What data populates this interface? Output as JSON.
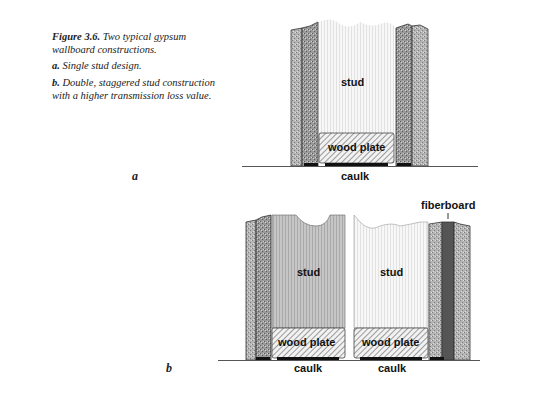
{
  "caption": {
    "figure_number": "Figure 3.6.",
    "title": "Two typical gypsum wallboard constructions.",
    "items": [
      {
        "key": "a.",
        "text": "Single stud design."
      },
      {
        "key": "b.",
        "text": "Double, staggered stud construction with a higher transmission loss value."
      }
    ]
  },
  "diagram_a": {
    "panel_label": "a",
    "labels": {
      "stud": "stud",
      "wood_plate": "wood plate",
      "caulk": "caulk"
    }
  },
  "diagram_b": {
    "panel_label": "b",
    "labels": {
      "stud_left": "stud",
      "stud_right": "stud",
      "wood_plate_left": "wood plate",
      "wood_plate_right": "wood plate",
      "caulk_left": "caulk",
      "caulk_right": "caulk",
      "fiberboard": "fiberboard"
    }
  },
  "colors": {
    "gypsum_light": "#b8b8b8",
    "gypsum_dark": "#8e8e8e",
    "stud_gray": "#c4c4c4",
    "stud_white": "#f3f3f3",
    "fiberboard": "#555555",
    "caulk": "#111111"
  }
}
